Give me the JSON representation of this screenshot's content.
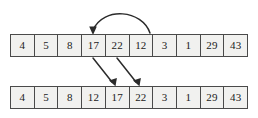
{
  "figure": {
    "background_color": "#ffffff",
    "cell_fill_color": "#f1f1ef",
    "border_color": "#4a4a4a",
    "text_color": "#1a1a1a",
    "arrow_color": "#2b2b2b"
  },
  "arrays": {
    "top": {
      "name": "before-array",
      "cells": [
        "4",
        "5",
        "8",
        "17",
        "22",
        "12",
        "3",
        "1",
        "29",
        "43"
      ]
    },
    "bottom": {
      "name": "after-array",
      "cells": [
        "4",
        "5",
        "8",
        "12",
        "17",
        "22",
        "3",
        "1",
        "29",
        "43"
      ]
    }
  },
  "arrows": [
    {
      "name": "insertion-curve-arrow",
      "kind": "curved",
      "from_cell_index": 5,
      "from_value": "12",
      "to_cell_index": 3,
      "to_value": "17",
      "path": "M 150 33 C 142 10, 104 6, 93 30",
      "head_points": "93,35 89.2,26.6 96.8,26.6"
    },
    {
      "name": "shift-arrow-17",
      "kind": "diagonal",
      "from_value": "17",
      "to_value": "17",
      "path": "M 93 58 L 112 82",
      "head_points": "115.5,86.2 109.0,80.6 116.9,78.0"
    },
    {
      "name": "shift-arrow-22",
      "kind": "diagonal",
      "from_value": "22",
      "to_value": "22",
      "path": "M 117 58 L 136 82",
      "head_points": "139.5,86.2 133.0,80.6 140.9,78.0"
    }
  ]
}
